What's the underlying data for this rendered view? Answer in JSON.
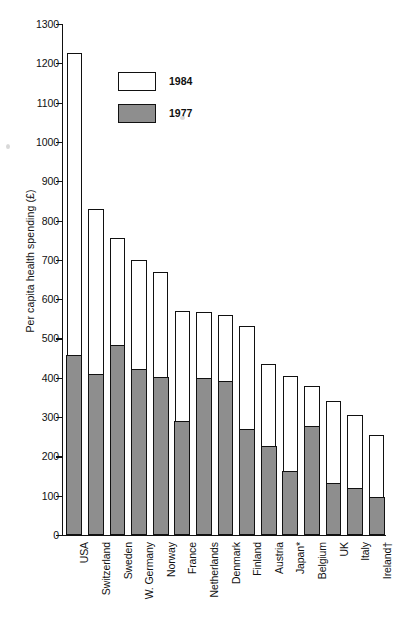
{
  "chart_data": {
    "type": "bar",
    "subtype": "stacked-overlay",
    "title": "",
    "xlabel": "",
    "ylabel": "Per capita health spending (£)",
    "ylim": [
      0,
      1300
    ],
    "ytick_step": 100,
    "yticks": [
      "0",
      "100",
      "200",
      "300",
      "400",
      "500",
      "600",
      "700",
      "800",
      "900",
      "1000",
      "1100",
      "1200",
      "1300"
    ],
    "grid": false,
    "legend_position": "inside-top-left",
    "legend": [
      "1984",
      "1977"
    ],
    "categories": [
      "USA",
      "Switzerland",
      "Sweden",
      "W. Germany",
      "Norway",
      "France",
      "Netherlands",
      "Denmark",
      "Finland",
      "Austria",
      "Japan*",
      "Belgium",
      "UK",
      "Italy",
      "Ireland†"
    ],
    "series": [
      {
        "name": "1984",
        "values": [
          1225,
          830,
          755,
          700,
          668,
          570,
          568,
          560,
          533,
          435,
          405,
          380,
          342,
          305,
          255
        ]
      },
      {
        "name": "1977",
        "values": [
          455,
          408,
          480,
          420,
          400,
          288,
          397,
          388,
          268,
          225,
          160,
          275,
          130,
          118,
          95
        ]
      }
    ],
    "colors": {
      "bar_1984_fill": "#ffffff",
      "bar_1977_fill": "#8e8e8e",
      "outline": "#111111",
      "background": "#ffffff"
    }
  },
  "footnote": ""
}
